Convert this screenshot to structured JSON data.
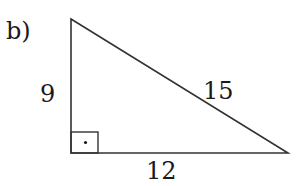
{
  "figure": {
    "part_label": "b)",
    "shape": "right-triangle",
    "sides": {
      "vertical_leg": "9",
      "horizontal_leg": "12",
      "hypotenuse": "15"
    },
    "right_angle_marker": "square-with-dot",
    "stroke_color": "#333333",
    "text_color": "#1a1a1a"
  }
}
